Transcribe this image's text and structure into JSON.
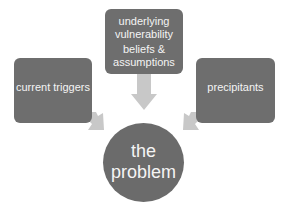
{
  "diagram": {
    "type": "convergent-arrows",
    "colors": {
      "box_fill": "#6e6e6e",
      "circle_fill": "#6b6b6b",
      "arrow_fill": "#c8c8c8",
      "text": "#f4f4f4",
      "background": "#ffffff"
    },
    "nodes": {
      "top": {
        "group1": [
          "underlying",
          "vulnerability"
        ],
        "group2": [
          "beliefs &",
          "assumptions"
        ]
      },
      "left": {
        "label": "current triggers"
      },
      "right": {
        "label": "precipitants"
      },
      "center": {
        "lines": [
          "the",
          "problem"
        ]
      }
    },
    "edges": [
      {
        "from": "top",
        "to": "center"
      },
      {
        "from": "left",
        "to": "center"
      },
      {
        "from": "right",
        "to": "center"
      }
    ]
  }
}
